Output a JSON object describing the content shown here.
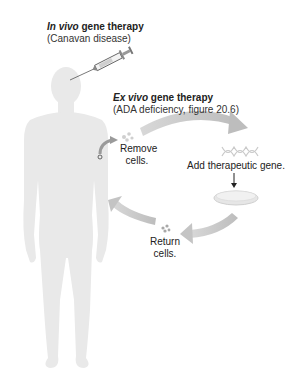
{
  "in_vivo": {
    "title_italic": "In vivo",
    "title_rest": " gene therapy",
    "subtitle": "(Canavan disease)"
  },
  "ex_vivo": {
    "title_italic": "Ex vivo",
    "title_rest": " gene therapy",
    "subtitle": "(ADA deficiency, figure 20.6)"
  },
  "steps": {
    "remove": [
      "Remove",
      "cells."
    ],
    "add": "Add therapeutic gene.",
    "return": [
      "Return",
      "cells."
    ]
  },
  "colors": {
    "body_silhouette": "#e9e9e9",
    "cycle_arrow": "#c8c8c8",
    "text": "#222222"
  }
}
